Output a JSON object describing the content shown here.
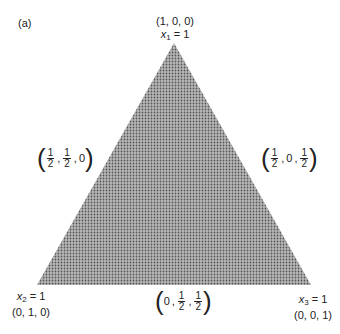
{
  "panel_label": "(a)",
  "vertices": {
    "top": {
      "coords": "(1, 0, 0)",
      "var": "x",
      "sub": "1",
      "eq": "= 1"
    },
    "bottom_left": {
      "coords": "(0, 1, 0)",
      "var": "x",
      "sub": "2",
      "eq": "= 1"
    },
    "bottom_right": {
      "coords": "(0, 0, 1)",
      "var": "x",
      "sub": "3",
      "eq": "= 1"
    }
  },
  "midpoints": {
    "left": {
      "a": {
        "num": "1",
        "den": "2"
      },
      "b": {
        "num": "1",
        "den": "2"
      },
      "c": "0"
    },
    "right": {
      "a": {
        "num": "1",
        "den": "2"
      },
      "b": "0",
      "c": {
        "num": "1",
        "den": "2"
      }
    },
    "bottom": {
      "a": "0",
      "b": {
        "num": "1",
        "den": "2"
      },
      "c": {
        "num": "1",
        "den": "2"
      }
    }
  },
  "colors": {
    "fill": "#9a9a9a",
    "dots": "#5a5a5a",
    "bg": "#ffffff"
  }
}
